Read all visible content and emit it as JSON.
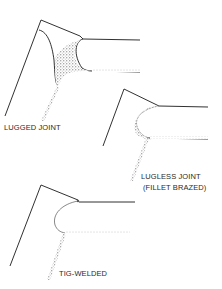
{
  "diagram": {
    "joints": [
      {
        "id": "lugged",
        "label": "LUGGED JOINT"
      },
      {
        "id": "lugless",
        "label": "LUGLESS JOINT",
        "sublabel": "(FILLET BRAZED)"
      },
      {
        "id": "tig",
        "label": "TIG-WELDED"
      }
    ]
  },
  "colors": {
    "line": "#1a1a1a",
    "stipple": "#555555",
    "background": "#ffffff"
  }
}
